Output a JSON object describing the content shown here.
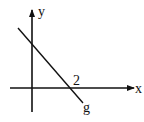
{
  "diagram": {
    "axis_labels": {
      "x": "x",
      "y": "y"
    },
    "line_label": "g",
    "intercept_label": "2",
    "line": {
      "x_intercept": 2,
      "slope_sign": "negative",
      "has_positive_y_intercept": true
    },
    "stroke_color": "#111111"
  }
}
